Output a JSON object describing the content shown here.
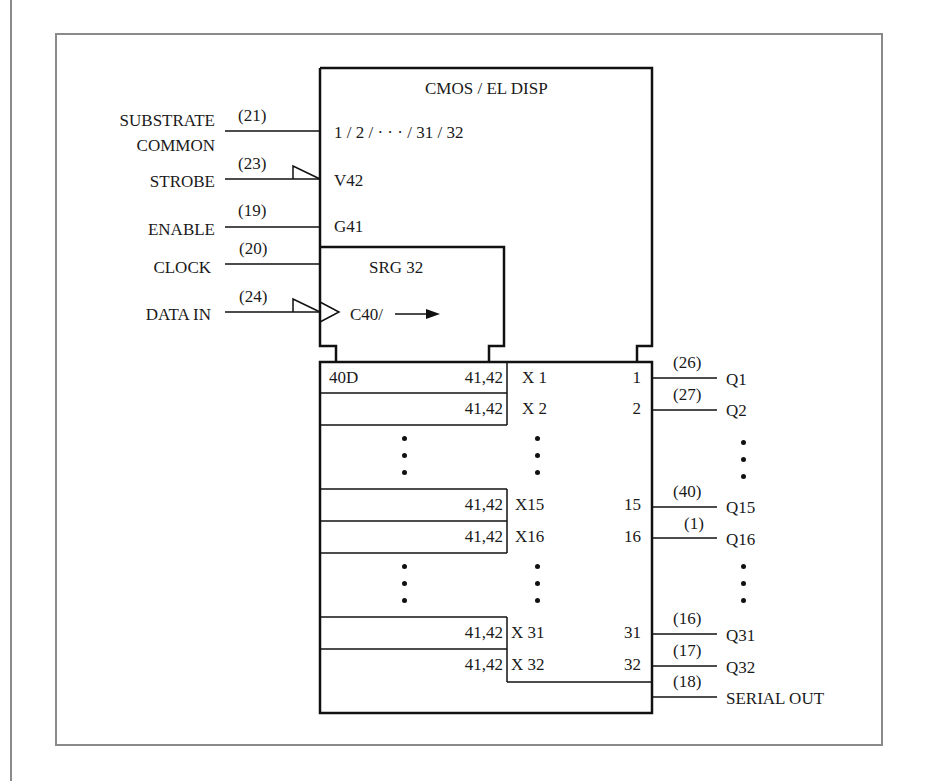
{
  "figure": {
    "block_title": "CMOS / EL DISP",
    "common_qualifier": "1 / 2 / · · · / 31 / 32",
    "strobe_qualifier": "V42",
    "enable_qualifier": "G41",
    "shift_register_title": "SRG 32",
    "clock_qualifier": "C40/",
    "shift_arrow": "→"
  },
  "inputs": [
    {
      "name": "SUBSTRATE",
      "name2": "COMMON",
      "pin": "(21)"
    },
    {
      "name": "STROBE",
      "pin": "(23)",
      "polarity_indicator": true
    },
    {
      "name": "ENABLE",
      "pin": "(19)"
    },
    {
      "name": "CLOCK",
      "pin": "(20)"
    },
    {
      "name": "DATA IN",
      "pin": "(24)",
      "polarity_indicator": true
    }
  ],
  "register_rows": [
    {
      "left": "40D",
      "dep": "41,42",
      "cell": "X 1",
      "out_num": "1",
      "pin": "(26)",
      "output": "Q1"
    },
    {
      "left": "",
      "dep": "41,42",
      "cell": "X 2",
      "out_num": "2",
      "pin": "(27)",
      "output": "Q2"
    },
    {
      "left": "",
      "dep": "41,42",
      "cell": "X15",
      "out_num": "15",
      "pin": "(40)",
      "output": "Q15"
    },
    {
      "left": "",
      "dep": "41,42",
      "cell": "X16",
      "out_num": "16",
      "pin": "(1)",
      "output": "Q16"
    },
    {
      "left": "",
      "dep": "41,42",
      "cell": "X 31",
      "out_num": "31",
      "pin": "(16)",
      "output": "Q31"
    },
    {
      "left": "",
      "dep": "41,42",
      "cell": "X 32",
      "out_num": "32",
      "pin": "(17)",
      "output": "Q32"
    }
  ],
  "serial_out": {
    "pin": "(18)",
    "name": "SERIAL OUT"
  },
  "colors": {
    "line": "#111111",
    "frame": "#8a8a8a"
  }
}
